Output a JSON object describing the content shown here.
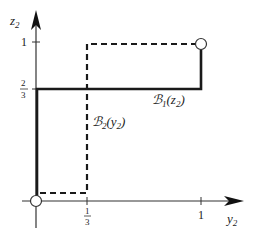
{
  "diagram": {
    "type": "best-response-correspondence",
    "axes": {
      "x": {
        "label": "y",
        "label_sub": "2",
        "ticks": [
          {
            "value": "1/3",
            "num": "1",
            "den": "3"
          },
          {
            "value": "1",
            "text": "1"
          }
        ]
      },
      "y": {
        "label": "z",
        "label_sub": "2",
        "ticks": [
          {
            "value": "2/3",
            "num": "2",
            "den": "3"
          },
          {
            "value": "1",
            "text": "1"
          }
        ]
      }
    },
    "curves": [
      {
        "name": "B1(z2)",
        "style": "solid",
        "label_script": "ℬ",
        "label_sub": "1",
        "label_arg": "(z",
        "label_arg_sub": "2",
        "label_close": ")",
        "points": [
          [
            0,
            0
          ],
          [
            0,
            0.6667
          ],
          [
            1,
            0.6667
          ],
          [
            1,
            1
          ]
        ]
      },
      {
        "name": "B2(y2)",
        "style": "dashed",
        "label_script": "ℬ",
        "label_sub": "2",
        "label_arg": "(y",
        "label_arg_sub": "2",
        "label_close": ")",
        "points": [
          [
            0,
            0.05
          ],
          [
            0.3333,
            0.05
          ],
          [
            0.3333,
            1
          ],
          [
            1,
            1
          ]
        ]
      }
    ],
    "equilibria": [
      {
        "point": [
          0,
          0
        ],
        "marker": "open-circle"
      },
      {
        "point": [
          1,
          1
        ],
        "marker": "open-circle"
      }
    ],
    "colors": {
      "line": "#1a1a1a",
      "background": "#ffffff"
    }
  }
}
